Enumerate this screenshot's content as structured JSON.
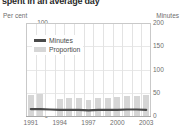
{
  "title": "spent in an average day",
  "axes": {
    "left_caption": "Per cent",
    "right_caption": "Minutes",
    "left_ticks": [
      "100",
      "75",
      "50",
      "25",
      "0"
    ],
    "right_ticks": [
      "200",
      "150",
      "100",
      "50",
      "0"
    ],
    "x_ticks": [
      "1991",
      "1994",
      "1997",
      "2000",
      "2003"
    ]
  },
  "legend": {
    "series_line_label": "Minutes",
    "series_bar_label": "Proportion"
  },
  "colors": {
    "bar": "#d6d6d6",
    "line": "#4a4a4a",
    "grid": "#e3e3e3",
    "frame": "#c9c9c9",
    "text": "#6e6e6e",
    "title": "#2b2b2b"
  },
  "chart_data": {
    "type": "bar",
    "title": "spent in an average day",
    "xlabel": "",
    "ylabel": "Per cent",
    "y2label": "Minutes",
    "ylim": [
      0,
      100
    ],
    "y2lim": [
      0,
      200
    ],
    "grid": true,
    "legend_position": "inside-top-left",
    "categories": [
      "1991",
      "1992",
      "1993",
      "1994",
      "1995",
      "1996",
      "1997",
      "1998",
      "1999",
      "2000",
      "2001",
      "2002",
      "2003"
    ],
    "series": [
      {
        "name": "Proportion",
        "unit": "per cent",
        "axis": "left",
        "render": "bar",
        "values": [
          23,
          24,
          null,
          18,
          19,
          19,
          17,
          19,
          19,
          20,
          21,
          22,
          23
        ]
      },
      {
        "name": "Minutes",
        "unit": "minutes",
        "axis": "right",
        "render": "line",
        "values": [
          15,
          15,
          14,
          13,
          13,
          13,
          12,
          13,
          13,
          13,
          14,
          14,
          13
        ]
      }
    ]
  }
}
